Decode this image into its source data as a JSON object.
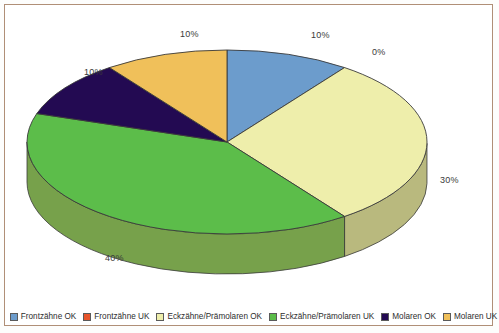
{
  "chart_data": {
    "type": "pie",
    "title": "",
    "subtitle": "",
    "xlabel": "",
    "ylabel": "",
    "three_d": true,
    "legend_position": "bottom",
    "grid": false,
    "categories": [
      "Frontzähne OK",
      "Frontzähne UK",
      "Eckzähne/Prämolaren OK",
      "Eckzähne/Prämolaren UK",
      "Molaren OK",
      "Molaren UK"
    ],
    "values": [
      10,
      0,
      30,
      40,
      10,
      10
    ],
    "value_labels": [
      "10%",
      "0%",
      "30%",
      "40%",
      "10%",
      "10%"
    ],
    "colors": [
      "#6c9ccc",
      "#e8552c",
      "#eeeeab",
      "#5cbd4a",
      "#230a52",
      "#f0c05a"
    ],
    "side_colors": [
      "#4f7aa6",
      "#b33f20",
      "#b9b97e",
      "#77a14b",
      "#1a0740",
      "#bf9442"
    ]
  },
  "labels": {
    "frontzaehne_ok": "10%",
    "frontzaehne_uk": "0%",
    "eckzaehne_ok": "30%",
    "eckzaehne_uk": "40%",
    "molaren_ok": "10%",
    "molaren_uk": "10%"
  },
  "legend": {
    "items": [
      {
        "label": "Frontzähne OK",
        "color": "#6c9ccc"
      },
      {
        "label": "Frontzähne UK",
        "color": "#e8552c"
      },
      {
        "label": "Eckzähne/Prämolaren OK",
        "color": "#eeeeab"
      },
      {
        "label": "Eckzähne/Prämolaren UK",
        "color": "#5cbd4a"
      },
      {
        "label": "Molaren OK",
        "color": "#230a52"
      },
      {
        "label": "Molaren UK",
        "color": "#f0c05a"
      }
    ]
  }
}
